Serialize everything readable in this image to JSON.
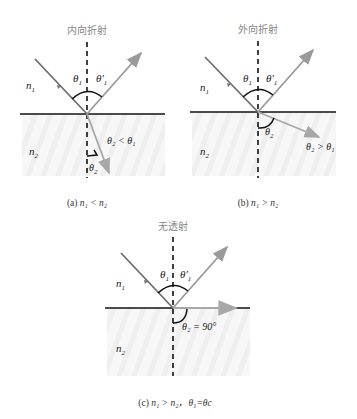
{
  "colors": {
    "incident": "#6e6e6e",
    "reflected": "#9a9a9a",
    "refracted": "#a8a8a8",
    "interface": "#111111",
    "normal": "#111111",
    "arc": "#111111",
    "medium2_shade": "#f2f2f2",
    "title": "#888888"
  },
  "panels": [
    {
      "id": "a",
      "title": "内向折射",
      "n1": "n",
      "n1_sub": "1",
      "n2": "n",
      "n2_sub": "2",
      "theta1": "θ",
      "theta1_sub": "1",
      "theta1p": "θ′",
      "theta1p_sub": "1",
      "theta2": "θ",
      "theta2_sub": "2",
      "relation": "θ₂ < θ₁",
      "caption_prefix": "(a) ",
      "caption_math": "n₁ < n₂"
    },
    {
      "id": "b",
      "title": "外向折射",
      "n1": "n",
      "n1_sub": "1",
      "n2": "n",
      "n2_sub": "2",
      "theta1": "θ",
      "theta1_sub": "1",
      "theta1p": "θ′",
      "theta1p_sub": "1",
      "theta2": "θ",
      "theta2_sub": "2",
      "relation": "θ₂ > θ₁",
      "caption_prefix": "(b) ",
      "caption_math": "n₁ > n₂"
    },
    {
      "id": "c",
      "title": "无透射",
      "n1": "n",
      "n1_sub": "1",
      "n2": "n",
      "n2_sub": "2",
      "theta1": "θ",
      "theta1_sub": "1",
      "theta1p": "θ′",
      "theta1p_sub": "1",
      "theta2_eq": "θ₂ = 90°",
      "caption_prefix": "(c) ",
      "caption_math": "n₁ > n₂，θ₁=θc"
    }
  ]
}
